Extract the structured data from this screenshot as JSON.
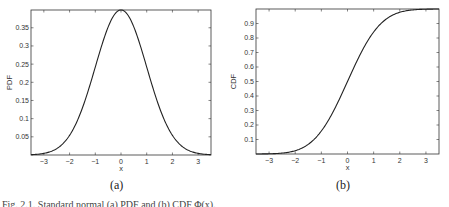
{
  "chart_data": [
    {
      "type": "line",
      "panel_label": "(a)",
      "title": "",
      "xlabel": "x",
      "ylabel": "PDF",
      "xlim": [
        -3.5,
        3.5
      ],
      "ylim": [
        0,
        0.3989
      ],
      "xticks": [
        -3,
        -2,
        -1,
        0,
        1,
        2,
        3
      ],
      "yticks": [
        0.05,
        0.1,
        0.15,
        0.2,
        0.25,
        0.3,
        0.35
      ],
      "ytick_labels": [
        "0.05",
        "0.1",
        "0.15",
        "0.2",
        "0.25",
        "0.3",
        "0.35"
      ],
      "grid": false,
      "series": [
        {
          "name": "Standard normal PDF",
          "x": [
            -3.5,
            -3,
            -2.5,
            -2,
            -1.5,
            -1,
            -0.5,
            0,
            0.5,
            1,
            1.5,
            2,
            2.5,
            3,
            3.5
          ],
          "y": [
            0.0009,
            0.0044,
            0.0175,
            0.054,
            0.1295,
            0.242,
            0.3521,
            0.3989,
            0.3521,
            0.242,
            0.1295,
            0.054,
            0.0175,
            0.0044,
            0.0009
          ]
        }
      ]
    },
    {
      "type": "line",
      "panel_label": "(b)",
      "title": "",
      "xlabel": "x",
      "ylabel": "CDF",
      "xlim": [
        -3.5,
        3.5
      ],
      "ylim": [
        0,
        1
      ],
      "xticks": [
        -3,
        -2,
        -1,
        0,
        1,
        2,
        3
      ],
      "yticks": [
        0.1,
        0.2,
        0.3,
        0.4,
        0.5,
        0.6,
        0.7,
        0.8,
        0.9
      ],
      "ytick_labels": [
        "0.1",
        "0.2",
        "0.3",
        "0.4",
        "0.5",
        "0.6",
        "0.7",
        "0.8",
        "0.9"
      ],
      "grid": false,
      "series": [
        {
          "name": "Standard normal CDF",
          "x": [
            -3.5,
            -3,
            -2.5,
            -2,
            -1.5,
            -1,
            -0.5,
            0,
            0.5,
            1,
            1.5,
            2,
            2.5,
            3,
            3.5
          ],
          "y": [
            0.0002,
            0.0013,
            0.0062,
            0.0228,
            0.0668,
            0.1587,
            0.3085,
            0.5,
            0.6915,
            0.8413,
            0.9332,
            0.9772,
            0.9938,
            0.9987,
            0.9998
          ]
        }
      ]
    }
  ],
  "labels": {
    "panel_a": "(a)",
    "panel_b": "(b)",
    "caption": "Fig. 2.1. Standard normal (a) PDF and (b) CDF Φ(x)."
  },
  "style": {
    "line_color": "#222222",
    "axis_color": "#333333"
  }
}
